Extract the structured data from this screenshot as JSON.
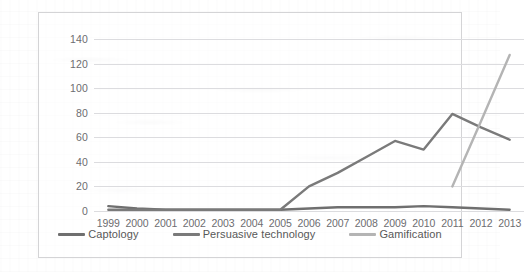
{
  "chart_data": {
    "type": "line",
    "title": "",
    "xlabel": "",
    "ylabel": "",
    "ylim": [
      0,
      140
    ],
    "ytick_step": 20,
    "yticks": [
      "140",
      "120",
      "100",
      "80",
      "60",
      "40",
      "20",
      "0"
    ],
    "grid": true,
    "legend_position": "bottom",
    "categories": [
      "1999",
      "2000",
      "2001",
      "2002",
      "2003",
      "2004",
      "2005",
      "2006",
      "2007",
      "2008",
      "2009",
      "2010",
      "2011",
      "2012",
      "2013"
    ],
    "series": [
      {
        "name": "Captology",
        "color": "#6f6f6f",
        "values": [
          4,
          2,
          1,
          1,
          1,
          1,
          1,
          2,
          3,
          3,
          3,
          4,
          3,
          2,
          1
        ]
      },
      {
        "name": "Persuasive technology",
        "color": "#7a7a7a",
        "values": [
          1,
          1,
          1,
          1,
          1,
          1,
          1,
          20,
          31,
          44,
          57,
          50,
          79,
          68,
          58
        ]
      },
      {
        "name": "Gamification",
        "color": "#b4b4b4",
        "values": [
          null,
          null,
          null,
          null,
          null,
          null,
          null,
          null,
          null,
          null,
          null,
          null,
          20,
          73,
          127
        ]
      }
    ]
  },
  "legend": {
    "items": [
      {
        "label": "Captology",
        "color": "#6f6f6f"
      },
      {
        "label": "Persuasive technology",
        "color": "#7a7a7a"
      },
      {
        "label": "Gamification",
        "color": "#b4b4b4"
      }
    ]
  }
}
